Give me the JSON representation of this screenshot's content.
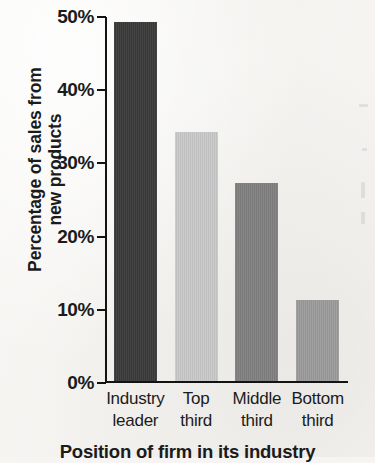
{
  "chart_data": {
    "type": "bar",
    "title": "",
    "subtitle": "",
    "xlabel": "Position of firm in its industry",
    "ylabel": "Percentage of sales from\nnew products",
    "categories": [
      "Industry\nleader",
      "Top\nthird",
      "Middle\nthird",
      "Bottom\nthird"
    ],
    "values": [
      49,
      34,
      27,
      11
    ],
    "value_unit": "%",
    "ylim": [
      0,
      50
    ],
    "yticks": [
      0,
      10,
      20,
      30,
      40,
      50
    ],
    "ytick_labels": [
      "0%",
      "10%",
      "20%",
      "30%",
      "40%",
      "50%"
    ],
    "grid": false,
    "legend": false,
    "legend_position": "none",
    "bar_colors": [
      "#3a3a3a",
      "#c9c9c9",
      "#808080",
      "#9b9b9b"
    ],
    "series": [
      {
        "name": "Percentage of sales from new products",
        "values": [
          49,
          34,
          27,
          11
        ]
      }
    ]
  },
  "axis": {
    "line_color": "#131313",
    "tick_color": "#131313"
  },
  "page": {
    "background_color": "#f6f5f3",
    "text_color": "#1b1b1b"
  }
}
